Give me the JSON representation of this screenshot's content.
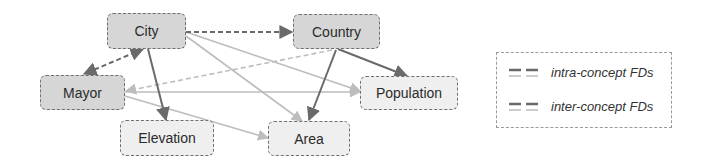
{
  "diagram": {
    "nodes": [
      {
        "id": "city",
        "label": "City",
        "fill": "dark"
      },
      {
        "id": "country",
        "label": "Country",
        "fill": "dark"
      },
      {
        "id": "mayor",
        "label": "Mayor",
        "fill": "dark"
      },
      {
        "id": "population",
        "label": "Population",
        "fill": "light"
      },
      {
        "id": "elevation",
        "label": "Elevation",
        "fill": "light"
      },
      {
        "id": "area",
        "label": "Area",
        "fill": "light"
      }
    ],
    "edges": [
      {
        "from": "City",
        "to": "Country",
        "type": "intra-concept",
        "style": "dark-dashed"
      },
      {
        "from": "City",
        "to": "Mayor",
        "type": "intra-concept",
        "style": "dark-dashed",
        "bidirectional": true
      },
      {
        "from": "City",
        "to": "Elevation",
        "type": "inter-concept",
        "style": "dark-solid"
      },
      {
        "from": "City",
        "to": "Population",
        "type": "inter-concept",
        "style": "light-solid"
      },
      {
        "from": "City",
        "to": "Area",
        "type": "inter-concept",
        "style": "light-solid"
      },
      {
        "from": "Country",
        "to": "Mayor",
        "type": "intra-concept",
        "style": "light-dashed"
      },
      {
        "from": "Country",
        "to": "Population",
        "type": "inter-concept",
        "style": "dark-solid"
      },
      {
        "from": "Country",
        "to": "Area",
        "type": "inter-concept",
        "style": "dark-solid"
      },
      {
        "from": "Mayor",
        "to": "Population",
        "type": "inter-concept",
        "style": "light-solid"
      },
      {
        "from": "Mayor",
        "to": "Area",
        "type": "inter-concept",
        "style": "light-solid"
      }
    ],
    "colors": {
      "dark_edge": "#6a6a6a",
      "light_edge": "#bdbdbd",
      "dark_fill": "#d6d6d6",
      "light_fill": "#efefef"
    }
  },
  "legend": {
    "items": [
      {
        "label": "intra-concept FDs",
        "icon": "dashed-line-pair-icon"
      },
      {
        "label": "inter-concept FDs",
        "icon": "solid-line-pair-icon"
      }
    ]
  }
}
